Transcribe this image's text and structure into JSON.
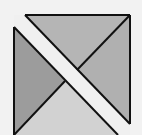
{
  "diagram": {
    "colors": {
      "background": "#f2f2f2",
      "top_triangle": "#b5b5b5",
      "right_triangle": "#b0b0b0",
      "left_triangle": "#9c9c9c",
      "bottom_triangle": "#d2d2d2",
      "band": "#f0f0f0",
      "stroke": "#111111"
    },
    "regions": [
      "top-triangle",
      "right-triangle",
      "left-triangle",
      "bottom-triangle",
      "diagonal-band"
    ]
  }
}
